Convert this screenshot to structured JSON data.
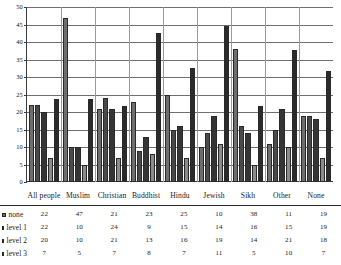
{
  "chart_data": {
    "type": "bar",
    "title": "",
    "subtitle": "",
    "xlabel": "",
    "ylabel": "",
    "ylim": [
      0,
      50
    ],
    "grid": true,
    "legend_position": "bottom-left-table",
    "categories": [
      "All people",
      "Muslim",
      "Christian",
      "Buddhist",
      "Hindu",
      "Jewish",
      "Sikh",
      "Other",
      "None"
    ],
    "yticks": [
      "0",
      "5",
      "10",
      "15",
      "20",
      "25",
      "30",
      "35",
      "40",
      "45",
      "50"
    ],
    "series": [
      {
        "name": "none",
        "color": "#6e6e6e",
        "values": [
          22,
          47,
          21,
          23,
          25,
          10,
          38,
          11,
          19
        ]
      },
      {
        "name": "level 1",
        "color": "#4a4a4a",
        "values": [
          22,
          10,
          24,
          9,
          15,
          14,
          16,
          15,
          19
        ]
      },
      {
        "name": "level 2",
        "color": "#353535",
        "values": [
          20,
          10,
          21,
          13,
          16,
          19,
          14,
          21,
          18
        ]
      },
      {
        "name": "level 3",
        "color": "#8c8c8c",
        "values": [
          7,
          5,
          7,
          8,
          7,
          11,
          5,
          10,
          7
        ]
      },
      {
        "name": "",
        "color": "#2b2b2b",
        "values": [
          23.8,
          23.8,
          21.7,
          42.5,
          32.7,
          44.5,
          21.6,
          37.6,
          31.8
        ]
      }
    ]
  },
  "table": {
    "rows": [
      {
        "label": "none",
        "values": [
          "22",
          "47",
          "21",
          "23",
          "25",
          "10",
          "38",
          "11",
          "19"
        ]
      },
      {
        "label": "level 1",
        "values": [
          "22",
          "10",
          "24",
          "9",
          "15",
          "14",
          "16",
          "15",
          "19"
        ]
      },
      {
        "label": "level 2",
        "values": [
          "20",
          "10",
          "21",
          "13",
          "16",
          "19",
          "14",
          "21",
          "18"
        ]
      },
      {
        "label": "level 3",
        "values": [
          "7",
          "5",
          "7",
          "8",
          "7",
          "11",
          "5",
          "10",
          "7"
        ]
      }
    ]
  }
}
